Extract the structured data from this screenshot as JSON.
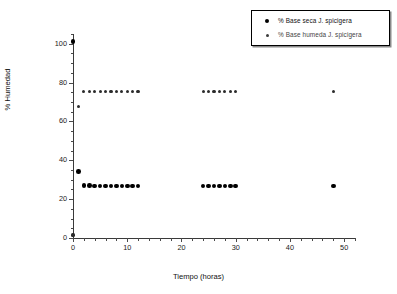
{
  "chart_data": {
    "type": "scatter",
    "title": "",
    "xlabel": "Tiempo (horas)",
    "ylabel": "% Humedad",
    "xlim": [
      0,
      52
    ],
    "ylim": [
      0,
      105
    ],
    "xticks": [
      0,
      10,
      20,
      30,
      40,
      50
    ],
    "yticks": [
      0,
      20,
      40,
      60,
      80,
      100
    ],
    "grid": false,
    "legend_position": "top-right",
    "series": [
      {
        "name": "% Base seca J. spicigera",
        "marker": "filled-circle-large",
        "color": "#000000",
        "points": [
          {
            "x": 0,
            "y": 101.0
          },
          {
            "x": 1,
            "y": 34.2
          },
          {
            "x": 2,
            "y": 26.9
          },
          {
            "x": 3,
            "y": 26.9
          },
          {
            "x": 4,
            "y": 26.8
          },
          {
            "x": 5,
            "y": 26.8
          },
          {
            "x": 6,
            "y": 26.8
          },
          {
            "x": 7,
            "y": 26.8
          },
          {
            "x": 8,
            "y": 26.8
          },
          {
            "x": 9,
            "y": 26.8
          },
          {
            "x": 10,
            "y": 26.8
          },
          {
            "x": 11,
            "y": 26.8
          },
          {
            "x": 12,
            "y": 26.8
          },
          {
            "x": 24,
            "y": 26.8
          },
          {
            "x": 25,
            "y": 26.8
          },
          {
            "x": 26,
            "y": 26.8
          },
          {
            "x": 27,
            "y": 26.8
          },
          {
            "x": 28,
            "y": 26.8
          },
          {
            "x": 29,
            "y": 26.8
          },
          {
            "x": 30,
            "y": 26.8
          },
          {
            "x": 48,
            "y": 26.8
          }
        ]
      },
      {
        "name": "% Base humeda J. spicigera",
        "marker": "filled-circle-small",
        "color": "#2b2b2b",
        "points": [
          {
            "x": 0,
            "y": 1.5
          },
          {
            "x": 1,
            "y": 67.8
          },
          {
            "x": 2,
            "y": 75.4
          },
          {
            "x": 3,
            "y": 75.5
          },
          {
            "x": 4,
            "y": 75.5
          },
          {
            "x": 5,
            "y": 75.5
          },
          {
            "x": 6,
            "y": 75.5
          },
          {
            "x": 7,
            "y": 75.5
          },
          {
            "x": 8,
            "y": 75.5
          },
          {
            "x": 9,
            "y": 75.5
          },
          {
            "x": 10,
            "y": 75.5
          },
          {
            "x": 11,
            "y": 75.5
          },
          {
            "x": 12,
            "y": 75.5
          },
          {
            "x": 24,
            "y": 75.5
          },
          {
            "x": 25,
            "y": 75.5
          },
          {
            "x": 26,
            "y": 75.5
          },
          {
            "x": 27,
            "y": 75.5
          },
          {
            "x": 28,
            "y": 75.5
          },
          {
            "x": 29,
            "y": 75.5
          },
          {
            "x": 30,
            "y": 75.5
          },
          {
            "x": 48,
            "y": 75.5
          }
        ]
      }
    ]
  },
  "legend": {
    "items": [
      {
        "label": "% Base seca J. spicigera",
        "marker_name": "legend-marker-dry"
      },
      {
        "label": "% Base humeda J. spicigera",
        "marker_name": "legend-marker-wet"
      }
    ]
  },
  "axes": {
    "x_label": "Tiempo (horas)",
    "y_label": "% Humedad",
    "x_tick_labels": [
      "0",
      "10",
      "20",
      "30",
      "40",
      "50"
    ],
    "y_tick_labels": [
      "0",
      "20",
      "40",
      "60",
      "80",
      "100"
    ]
  },
  "colors": {
    "background": "#ffffff",
    "axis": "#3a3a3a",
    "series_dry": "#000000",
    "series_wet": "#2b2b2b",
    "text": "#111111"
  }
}
